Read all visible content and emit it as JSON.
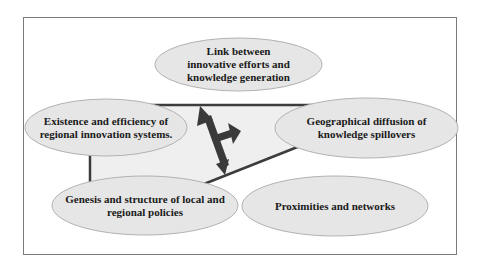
{
  "diagram": {
    "type": "concept-map",
    "colors": {
      "frame_border": "#7a7a7a",
      "ellipse_fill": "#e6e6e6",
      "ellipse_border": "#b2b2b2",
      "polygon_fill": "#efefef",
      "polygon_edge": "#3c3c3c",
      "arrow": "#3a3a3a",
      "text": "#1a1a1a"
    },
    "nodes": [
      {
        "id": "link",
        "label": "Link between\ninnovative efforts and\n knowledge generation"
      },
      {
        "id": "existence",
        "label": "Existence and efficiency of\nregional innovation systems."
      },
      {
        "id": "geographical",
        "label": "Geographical diffusion of\nknowledge spillovers"
      },
      {
        "id": "genesis",
        "label": "Genesis and structure of local and\nregional policies"
      },
      {
        "id": "proximities",
        "label": "Proximities and networks"
      }
    ],
    "connector": {
      "shape": "quadrilateral",
      "arrow": "three-headed arrow (up-left, right, down)"
    }
  }
}
